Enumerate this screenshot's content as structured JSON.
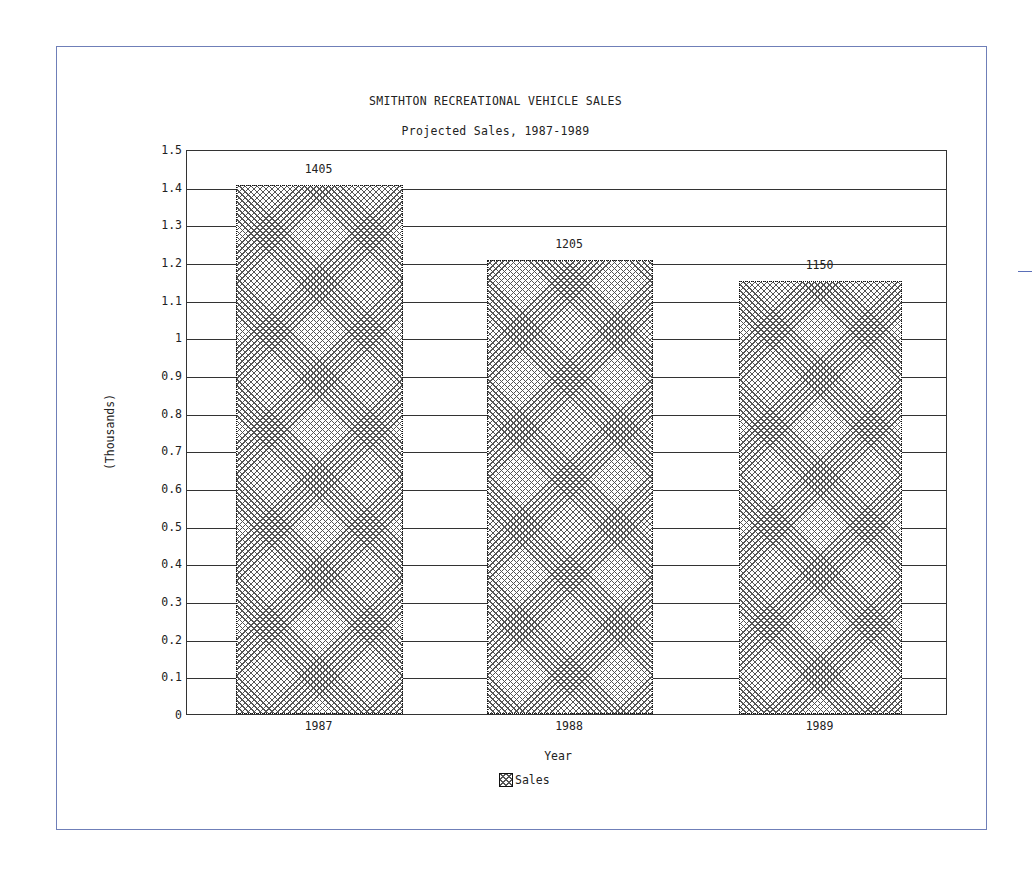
{
  "chart_data": {
    "type": "bar",
    "title": "SMITHTON RECREATIONAL VEHICLE SALES",
    "subtitle": "Projected Sales, 1987-1989",
    "xlabel": "Year",
    "ylabel": "(Thousands)",
    "categories": [
      "1987",
      "1988",
      "1989"
    ],
    "series": [
      {
        "name": "Sales",
        "values": [
          1.405,
          1.205,
          1.15
        ],
        "data_labels": [
          "1405",
          "1205",
          "1150"
        ]
      }
    ],
    "ylim": [
      0,
      1.5
    ],
    "yticks": [
      "0",
      "0.1",
      "0.2",
      "0.3",
      "0.4",
      "0.5",
      "0.6",
      "0.7",
      "0.8",
      "0.9",
      "1",
      "1.1",
      "1.2",
      "1.3",
      "1.4",
      "1.5"
    ],
    "grid": true,
    "legend_position": "bottom-center",
    "bar_fill": "crosshatch"
  },
  "colors": {
    "frame": "#6f7fb8",
    "axis": "#333333",
    "hatch": "#555555"
  }
}
